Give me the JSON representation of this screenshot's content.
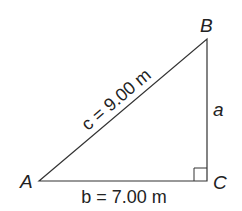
{
  "diagram": {
    "type": "right-triangle",
    "vertices": {
      "A": {
        "label": "A"
      },
      "B": {
        "label": "B"
      },
      "C": {
        "label": "C"
      }
    },
    "sides": {
      "a": {
        "label": "a"
      },
      "b": {
        "label": "b = 7.00 m"
      },
      "c": {
        "label": "c = 9.00 m"
      }
    },
    "right_angle_at": "C",
    "line_color": "#333333"
  }
}
